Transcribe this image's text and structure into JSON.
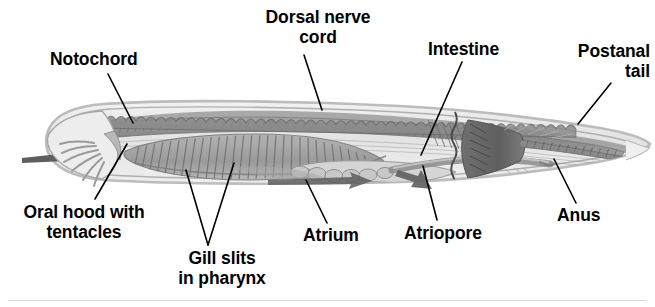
{
  "figure": {
    "background_color": "#ffffff",
    "line_color": "#000000",
    "body_fill": "#e9e9e9",
    "body_outline": "#8c8c8c",
    "muscle_fill": "#9a9a9a",
    "dark_muscle_fill": "#6f6f6f",
    "notochord_fill": "#8f8f8f",
    "pharynx_fill": "#a5a5a5"
  },
  "labels": [
    {
      "id": "notochord",
      "name": "Notochord",
      "lines": [
        "Notochord"
      ],
      "x": 50,
      "y": 50,
      "align": "left",
      "leader": {
        "x1": 108,
        "y1": 74,
        "x2": 133,
        "y2": 123
      }
    },
    {
      "id": "dorsal-nerve-cord",
      "name": "Dorsal nerve cord",
      "lines": [
        "Dorsal nerve",
        "cord"
      ],
      "x": 318,
      "y": 8,
      "align": "center",
      "leader": {
        "x1": 304,
        "y1": 55,
        "x2": 322,
        "y2": 110
      }
    },
    {
      "id": "intestine",
      "name": "Intestine",
      "lines": [
        "Intestine"
      ],
      "x": 428,
      "y": 40,
      "align": "left",
      "leader": {
        "x1": 462,
        "y1": 62,
        "x2": 421,
        "y2": 155
      }
    },
    {
      "id": "postanal-tail",
      "name": "Postanal tail",
      "lines": [
        "Postanal",
        "tail"
      ],
      "x": 650,
      "y": 42,
      "align": "right",
      "leader": {
        "x1": 611,
        "y1": 83,
        "x2": 578,
        "y2": 124
      }
    },
    {
      "id": "oral-hood-with-tentacles",
      "name": "Oral hood with tentacles",
      "lines": [
        "Oral hood with",
        "tentacles"
      ],
      "x": 84,
      "y": 203,
      "align": "center",
      "leader": {
        "x1": 95,
        "y1": 199,
        "x2": 127,
        "y2": 144
      }
    },
    {
      "id": "gill-slits-in-pharynx",
      "name": "Gill slits in pharynx",
      "lines": [
        "Gill slits",
        "in pharynx"
      ],
      "x": 222,
      "y": 249,
      "align": "center",
      "leader": {
        "x1": 208,
        "y1": 245,
        "x2": 186,
        "y2": 170
      },
      "leader2": {
        "x1": 208,
        "y1": 245,
        "x2": 234,
        "y2": 163
      }
    },
    {
      "id": "atrium",
      "name": "Atrium",
      "lines": [
        "Atrium"
      ],
      "x": 303,
      "y": 226,
      "align": "left",
      "leader": {
        "x1": 327,
        "y1": 223,
        "x2": 306,
        "y2": 180
      }
    },
    {
      "id": "atriopore",
      "name": "Atriopore",
      "lines": [
        "Atriopore"
      ],
      "x": 404,
      "y": 224,
      "align": "left",
      "leader": {
        "x1": 437,
        "y1": 220,
        "x2": 423,
        "y2": 166
      }
    },
    {
      "id": "anus",
      "name": "Anus",
      "lines": [
        "Anus"
      ],
      "x": 557,
      "y": 206,
      "align": "left",
      "leader": {
        "x1": 576,
        "y1": 203,
        "x2": 554,
        "y2": 159
      }
    }
  ],
  "structures": {
    "water_flow_in_arrow": "incoming water current arrow at oral hood",
    "water_flow_out_arrow": "outgoing water current arrow at atriopore",
    "myomeres": "segmented muscle blocks along dorsal body",
    "gill_bars": "diagonal gill slit striations in pharynx"
  }
}
